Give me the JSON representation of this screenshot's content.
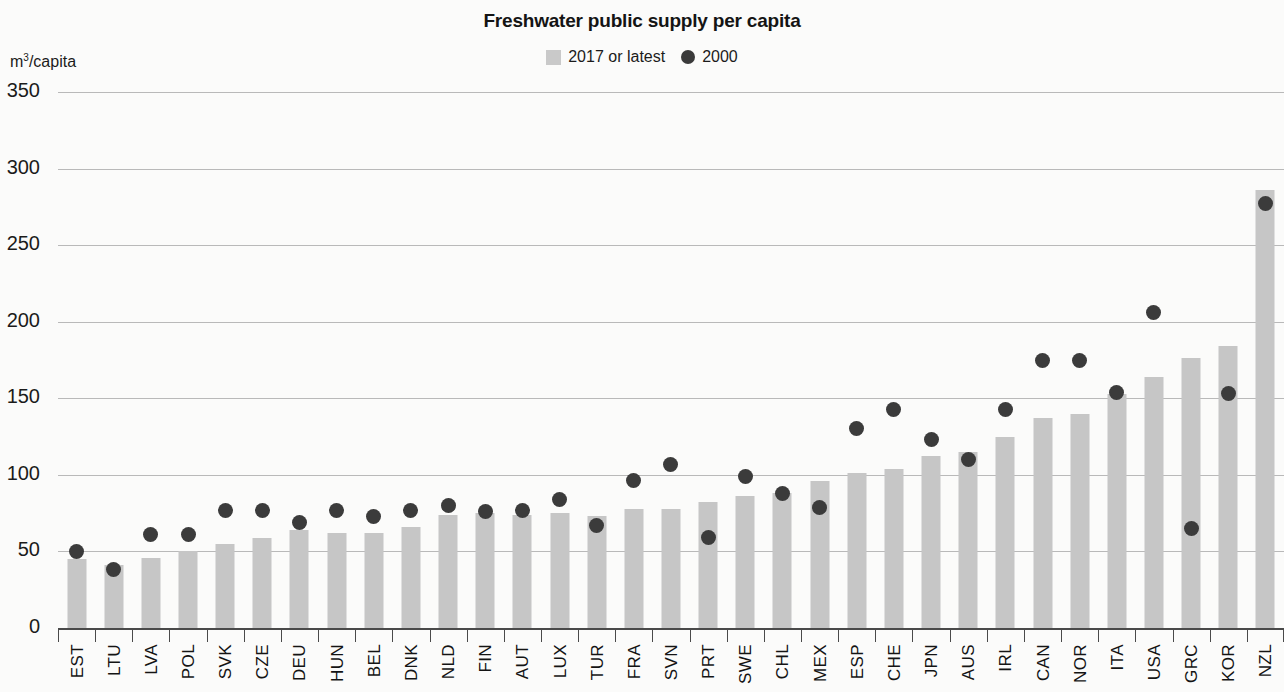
{
  "chart_data": {
    "type": "bar",
    "title": "Freshwater public supply per capita",
    "xlabel": "",
    "ylabel": "m³/capita",
    "ylim": [
      0,
      350
    ],
    "ytick_values": [
      350,
      300,
      250,
      200,
      150,
      100,
      50,
      0
    ],
    "ytick_labels": [
      "350",
      "300",
      "250",
      "200",
      "150",
      "100",
      "50",
      "0"
    ],
    "grid": true,
    "legend_position": "top-center",
    "legend": [
      "2017 or latest",
      "2000"
    ],
    "categories": [
      "EST",
      "LTU",
      "LVA",
      "POL",
      "SVK",
      "CZE",
      "DEU",
      "HUN",
      "BEL",
      "DNK",
      "NLD",
      "FIN",
      "AUT",
      "LUX",
      "TUR",
      "FRA",
      "SVN",
      "PRT",
      "SWE",
      "CHL",
      "MEX",
      "ESP",
      "CHE",
      "JPN",
      "AUS",
      "IRL",
      "CAN",
      "NOR",
      "ITA",
      "USA",
      "GRC",
      "KOR",
      "NZL"
    ],
    "series": [
      {
        "name": "2017 or latest",
        "type": "bar",
        "color": "#c6c6c6",
        "values": [
          45,
          41,
          46,
          50,
          55,
          59,
          64,
          62,
          62,
          66,
          74,
          75,
          74,
          75,
          73,
          78,
          78,
          82,
          86,
          88,
          96,
          101,
          104,
          112,
          115,
          125,
          137,
          140,
          153,
          164,
          176,
          184,
          286
        ]
      },
      {
        "name": "2000",
        "type": "scatter",
        "color": "#3b3b3b",
        "values": [
          50,
          38,
          61,
          61,
          77,
          77,
          69,
          77,
          73,
          77,
          80,
          76,
          77,
          84,
          67,
          96,
          107,
          59,
          99,
          88,
          79,
          130,
          143,
          123,
          110,
          143,
          175,
          175,
          154,
          206,
          65,
          153,
          277
        ]
      }
    ]
  },
  "colors": {
    "bar": "#c6c6c6",
    "dot": "#3b3b3b",
    "gridline": "#b9b9b9",
    "axis": "#4a4a4a",
    "text": "#141414",
    "background": "#fbfbfa"
  }
}
